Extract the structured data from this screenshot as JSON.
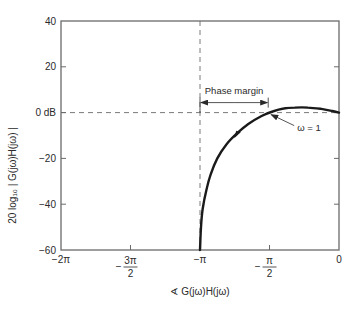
{
  "chart_data": {
    "type": "line",
    "title": "",
    "xlabel": "∢ G(jω)H(jω)",
    "ylabel": "20 log₁₀ | G(jω)H(jω) |",
    "xlim": [
      -6.2832,
      0
    ],
    "ylim": [
      -60,
      40
    ],
    "grid": false,
    "x_ticks": [
      {
        "value": -6.2832,
        "label": "−2π"
      },
      {
        "value": -4.7124,
        "label_num": "3π",
        "label_den": "2",
        "sign": "−"
      },
      {
        "value": -3.1416,
        "label": "−π"
      },
      {
        "value": -1.5708,
        "label_num": "π",
        "label_den": "2",
        "sign": "−"
      },
      {
        "value": 0,
        "label": "0"
      }
    ],
    "y_ticks": [
      {
        "value": 40,
        "label": "40"
      },
      {
        "value": 20,
        "label": "20"
      },
      {
        "value": 0,
        "label": "0 dB"
      },
      {
        "value": -20,
        "label": "−20"
      },
      {
        "value": -40,
        "label": "−40"
      },
      {
        "value": -60,
        "label": "−60"
      }
    ],
    "series": [
      {
        "name": "G(jω)H(jω) locus",
        "x": [
          -3.1416,
          -3.12,
          -3.08,
          -3.0,
          -2.9,
          -2.75,
          -2.55,
          -2.3,
          -2.05,
          -1.75,
          -1.5,
          -1.25,
          -1.0,
          -0.7,
          -0.4,
          -0.15,
          0
        ],
        "y": [
          -60,
          -50,
          -42,
          -34,
          -27,
          -20,
          -14,
          -9,
          -5,
          -1.5,
          0.5,
          1.8,
          2.2,
          2.2,
          1.6,
          0.7,
          0
        ]
      }
    ],
    "reference_lines": [
      {
        "orientation": "horizontal",
        "value": 0,
        "style": "dashed"
      },
      {
        "orientation": "vertical",
        "value": -3.1416,
        "style": "dashed"
      }
    ],
    "annotations": {
      "phase_margin": {
        "label": "Phase margin",
        "from_x": -3.1416,
        "to_x": -1.6
      },
      "omega_marker": {
        "label": "ω = 1",
        "x": -1.6,
        "y": 0
      }
    }
  }
}
